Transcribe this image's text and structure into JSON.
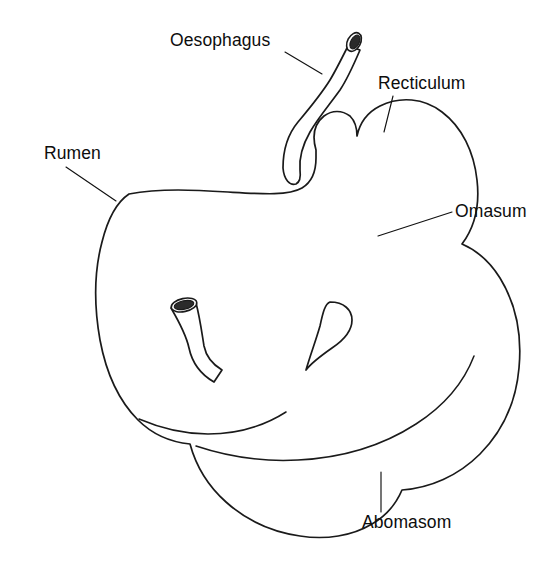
{
  "figure": {
    "background_color": "#ffffff",
    "ink_color": "#1a1a1a",
    "style": "stippled pen-and-ink line drawing",
    "width": 555,
    "height": 588
  },
  "labels": [
    {
      "id": "oesophagus",
      "text": "Oesophagus",
      "text_x": 170,
      "text_y": 46,
      "anchor": "start",
      "leader": "M 285 52 L 322 74",
      "description": "upper tube entering the stomach from above"
    },
    {
      "id": "recticulum",
      "text": "Recticulum",
      "text_x": 378,
      "text_y": 89,
      "anchor": "start",
      "leader": "M 393 96 L 384 132",
      "description": "rounded bulb at upper right"
    },
    {
      "id": "rumen",
      "text": "Rumen",
      "text_x": 44,
      "text_y": 159,
      "anchor": "start",
      "leader": "M 66 167 L 116 201",
      "description": "large left body of the stomach"
    },
    {
      "id": "omasum",
      "text": "Omasum",
      "text_x": 455,
      "text_y": 217,
      "anchor": "start",
      "leader": "M 378 236 L 452 212",
      "description": "narrow waist below the recticulum"
    },
    {
      "id": "abomasom",
      "text": "Abomasom",
      "text_x": 362,
      "text_y": 528,
      "anchor": "start",
      "leader": "M 381 472 L 381 512",
      "description": "lower right chamber, true stomach"
    }
  ],
  "shapes": {
    "main_outline": "M 129 194 C 160 188 196 190 228 192 C 262 194 288 196 302 188 C 312 182 316 170 316 158 L 316 150 C 312 136 314 124 324 116 C 332 110 342 110 350 116 C 355 121 357 128 357 136 C 360 122 368 112 380 106 C 400 96 424 98 442 112 C 462 127 474 152 477 180 C 480 206 474 228 462 244 C 476 250 490 262 500 278 C 516 304 522 336 519 368 C 516 402 502 432 480 454 C 458 476 430 488 402 490 C 396 504 386 516 372 524 C 352 536 326 540 300 536 C 272 532 246 520 226 502 C 208 486 196 466 190 444 C 170 442 152 434 138 420 C 118 400 106 372 100 340 C 94 306 94 272 102 242 C 108 218 117 202 129 194 Z",
    "abomasum_divider": "M 196 446 C 226 456 262 462 298 460 C 340 458 382 446 416 424 C 444 406 464 382 474 356",
    "rumen_lobe_divider": "M 139 419 C 160 428 184 434 208 434 C 236 434 264 426 286 412",
    "teardrop_gap": "M 330 302 C 344 302 352 310 352 320 C 352 330 344 340 332 348 C 322 355 312 362 306 370 C 310 356 316 340 320 326 C 323 312 325 304 330 302 Z",
    "oesophagus_tube": "M 283 168 C 283 150 288 134 298 122 C 308 110 320 96 330 80 C 336 70 342 58 348 46 L 360 50 C 354 64 348 78 340 90 C 330 104 318 118 310 132 C 302 146 299 158 300 170 C 301 178 300 182 296 184 C 290 186 284 180 283 168 Z",
    "oesophagus_rim_outer": {
      "cx": 354,
      "cy": 42,
      "rx": 10,
      "ry": 6.5,
      "rot": -62
    },
    "oesophagus_rim_inner": {
      "cx": 355,
      "cy": 42,
      "rx": 7.5,
      "ry": 4.2,
      "rot": -62
    },
    "duodenum_tube": "M 171 308 L 196 303 C 200 318 202 334 204 346 C 206 356 212 364 222 370 L 214 382 C 200 374 192 362 189 348 C 186 334 178 320 171 308 Z",
    "duodenum_rim_outer": {
      "cx": 184,
      "cy": 305,
      "rx": 13,
      "ry": 6.5,
      "rot": -12
    },
    "duodenum_rim_inner": {
      "cx": 184,
      "cy": 305,
      "rx": 10,
      "ry": 4.2,
      "rot": -12
    }
  },
  "stipple": {
    "seed": 20240617,
    "description": "Dense ink stippling shading the organ interior; heaviest along the right and lower-right margins of the recticulum and abomasum.",
    "regions": [
      {
        "id": "rumen-upper-left",
        "cx": 150,
        "cy": 250,
        "rx": 75,
        "ry": 70,
        "density": 0.22,
        "max_r": 1.05
      },
      {
        "id": "rumen-left-edge",
        "cx": 118,
        "cy": 330,
        "rx": 45,
        "ry": 95,
        "density": 0.42,
        "max_r": 1.15
      },
      {
        "id": "rumen-lower-left",
        "cx": 150,
        "cy": 420,
        "rx": 62,
        "ry": 70,
        "density": 0.5,
        "max_r": 1.2
      },
      {
        "id": "rumen-lower-lobe",
        "cx": 235,
        "cy": 480,
        "rx": 85,
        "ry": 58,
        "density": 0.44,
        "max_r": 1.2
      },
      {
        "id": "rumen-lobe-bottom",
        "cx": 300,
        "cy": 516,
        "rx": 72,
        "ry": 30,
        "density": 0.7,
        "max_r": 1.3
      },
      {
        "id": "rumen-mid",
        "cx": 215,
        "cy": 345,
        "rx": 80,
        "ry": 62,
        "density": 0.16,
        "max_r": 1.0
      },
      {
        "id": "oesoph-base",
        "cx": 300,
        "cy": 205,
        "rx": 42,
        "ry": 55,
        "density": 0.52,
        "max_r": 1.2
      },
      {
        "id": "oesoph-tube-shade",
        "cx": 320,
        "cy": 120,
        "rx": 16,
        "ry": 45,
        "density": 0.55,
        "max_r": 1.0
      },
      {
        "id": "oesoph-tube-top",
        "cx": 342,
        "cy": 64,
        "rx": 11,
        "ry": 20,
        "density": 0.6,
        "max_r": 1.0
      },
      {
        "id": "recticulum-right",
        "cx": 448,
        "cy": 170,
        "rx": 36,
        "ry": 58,
        "density": 0.72,
        "max_r": 1.35
      },
      {
        "id": "recticulum-mid",
        "cx": 412,
        "cy": 165,
        "rx": 34,
        "ry": 58,
        "density": 0.34,
        "max_r": 1.1
      },
      {
        "id": "recticulum-left",
        "cx": 372,
        "cy": 178,
        "rx": 28,
        "ry": 48,
        "density": 0.15,
        "max_r": 0.95
      },
      {
        "id": "omasum-neck",
        "cx": 436,
        "cy": 238,
        "rx": 30,
        "ry": 30,
        "density": 0.8,
        "max_r": 1.4
      },
      {
        "id": "abomasum-right",
        "cx": 488,
        "cy": 330,
        "rx": 34,
        "ry": 78,
        "density": 0.66,
        "max_r": 1.3
      },
      {
        "id": "abomasum-lower-right",
        "cx": 460,
        "cy": 420,
        "rx": 52,
        "ry": 62,
        "density": 0.62,
        "max_r": 1.3
      },
      {
        "id": "abomasum-bottom",
        "cx": 392,
        "cy": 468,
        "rx": 70,
        "ry": 36,
        "density": 0.5,
        "max_r": 1.25
      },
      {
        "id": "abomasum-mid",
        "cx": 400,
        "cy": 370,
        "rx": 70,
        "ry": 70,
        "density": 0.2,
        "max_r": 1.0
      },
      {
        "id": "abomasum-upper",
        "cx": 372,
        "cy": 300,
        "rx": 66,
        "ry": 46,
        "density": 0.26,
        "max_r": 1.05
      },
      {
        "id": "central-ridge",
        "cx": 300,
        "cy": 290,
        "rx": 48,
        "ry": 34,
        "density": 0.46,
        "max_r": 1.15
      },
      {
        "id": "duodenum-shade",
        "cx": 200,
        "cy": 340,
        "rx": 22,
        "ry": 40,
        "density": 0.4,
        "max_r": 1.05
      },
      {
        "id": "mid-junction",
        "cx": 262,
        "cy": 404,
        "rx": 60,
        "ry": 34,
        "density": 0.38,
        "max_r": 1.1
      }
    ]
  }
}
